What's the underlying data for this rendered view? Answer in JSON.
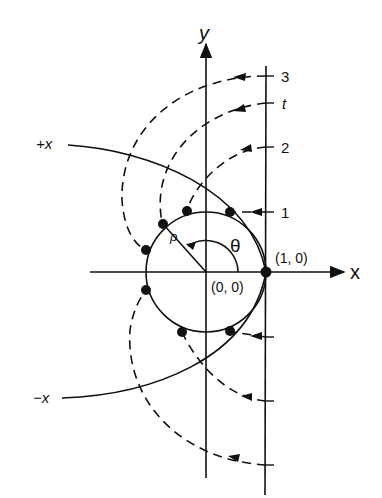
{
  "figure": {
    "axes": {
      "x_label": "x",
      "y_label": "y"
    },
    "points": {
      "origin_label": "(0, 0)",
      "unit_label": "(1, 0)"
    },
    "angle_label": "θ",
    "radius_label": "ρ",
    "curve_labels": {
      "plus_x": "+x",
      "minus_x": "−x"
    },
    "tick_labels": {
      "t3": "3",
      "tt": "t",
      "t2": "2",
      "t1": "1"
    },
    "colors": {
      "ink": "#111111",
      "background": "#ffffff"
    }
  }
}
